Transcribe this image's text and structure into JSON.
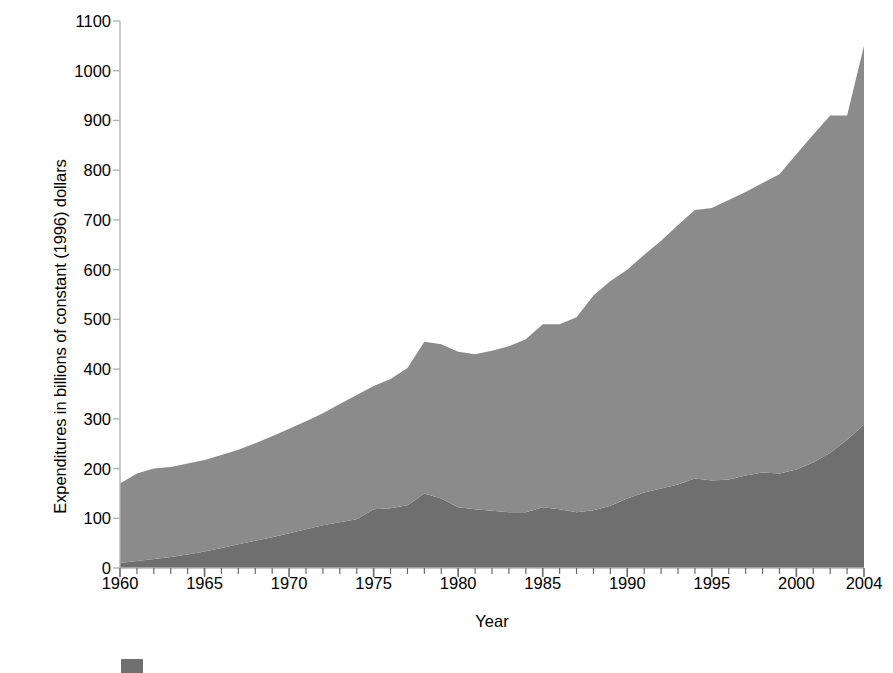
{
  "chart_data": {
    "type": "area",
    "stacked": true,
    "title": "",
    "xlabel": "Year",
    "ylabel": "Expenditures in billions of constant (1996) dollars",
    "xlim": [
      1960,
      2004
    ],
    "ylim": [
      0,
      1100
    ],
    "ytick_step": 100,
    "xtick_major_step": 5,
    "xtick_minor_step": 1,
    "grid": false,
    "legend_position": "below-axis",
    "yticks": [
      0,
      100,
      200,
      300,
      400,
      500,
      600,
      700,
      800,
      900,
      1000,
      1100
    ],
    "ytick_labels": [
      "0",
      "100",
      "200",
      "300",
      "400",
      "500",
      "600",
      "700",
      "800",
      "900",
      "1000",
      "1100"
    ],
    "xticks": [
      1960,
      1965,
      1970,
      1975,
      1980,
      1985,
      1990,
      1995,
      2000,
      2004
    ],
    "xtick_labels": [
      "1960",
      "1965",
      "1970",
      "1975",
      "1980",
      "1985",
      "1990",
      "1995",
      "2000",
      "2004"
    ],
    "x": [
      1960,
      1961,
      1962,
      1963,
      1964,
      1965,
      1966,
      1967,
      1968,
      1969,
      1970,
      1971,
      1972,
      1973,
      1974,
      1975,
      1976,
      1977,
      1978,
      1979,
      1980,
      1981,
      1982,
      1983,
      1984,
      1985,
      1986,
      1987,
      1988,
      1989,
      1990,
      1991,
      1992,
      1993,
      1994,
      1995,
      1996,
      1997,
      1998,
      1999,
      2000,
      2001,
      2002,
      2003,
      2004
    ],
    "series": [
      {
        "name": "lower-series",
        "color": "#6f6f6f",
        "values": [
          10,
          14,
          18,
          22,
          27,
          33,
          40,
          48,
          55,
          62,
          70,
          78,
          86,
          92,
          98,
          118,
          120,
          126,
          150,
          140,
          122,
          118,
          115,
          112,
          112,
          122,
          118,
          112,
          116,
          125,
          140,
          152,
          160,
          168,
          180,
          176,
          178,
          186,
          192,
          190,
          198,
          212,
          232,
          258,
          288
        ]
      },
      {
        "name": "upper-series",
        "color": "#8b8b8b",
        "values": [
          160,
          176,
          182,
          181,
          183,
          184,
          187,
          190,
          196,
          203,
          210,
          217,
          225,
          238,
          250,
          248,
          260,
          276,
          305,
          310,
          313,
          312,
          322,
          334,
          348,
          368,
          372,
          392,
          432,
          452,
          460,
          478,
          498,
          522,
          540,
          548,
          562,
          570,
          582,
          602,
          634,
          660,
          678,
          652,
          762
        ]
      }
    ],
    "totals": [
      170,
      190,
      200,
      203,
      210,
      217,
      227,
      238,
      251,
      265,
      280,
      295,
      311,
      330,
      348,
      366,
      380,
      402,
      455,
      450,
      435,
      430,
      437,
      446,
      460,
      490,
      490,
      504,
      548,
      577,
      600,
      630,
      658,
      690,
      720,
      724,
      740,
      756,
      774,
      792,
      832,
      872,
      910,
      910,
      1050
    ],
    "legend": [
      {
        "swatch_color": "#6f6f6f",
        "label": ""
      }
    ]
  },
  "layout": {
    "plot_left": 120,
    "plot_right": 864,
    "plot_top": 21,
    "plot_bottom": 568,
    "axis_color": "#b4b4b4"
  }
}
